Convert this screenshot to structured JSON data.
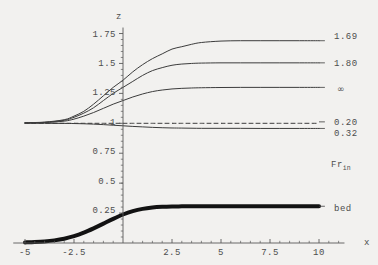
{
  "chart_data": {
    "type": "line",
    "title": "",
    "xlabel": "x",
    "ylabel": "z",
    "xlim": [
      -5,
      10
    ],
    "ylim": [
      0,
      1.8
    ],
    "grid": false,
    "legend_position": "right",
    "x_ticks": [
      "-5",
      "-2.5",
      "2.5",
      "5",
      "7.5",
      "10"
    ],
    "x_tick_values": [
      -5,
      -2.5,
      2.5,
      5,
      7.5,
      10
    ],
    "y_ticks": [
      "1.75",
      "1.5",
      "1.25",
      "1",
      "0.75",
      "0.5",
      "0.25"
    ],
    "y_tick_values": [
      1.75,
      1.5,
      1.25,
      1,
      0.75,
      0.5,
      0.25
    ],
    "legend_title": "Fr",
    "legend_title_sub": "in",
    "series": [
      {
        "name": "1.69",
        "style": "solid",
        "width": 1,
        "color": "#3c3c3c",
        "x": [
          -5,
          -4,
          -3,
          -2.5,
          -2,
          -1.5,
          -1,
          -0.5,
          0,
          0.5,
          1,
          1.5,
          2,
          2.5,
          3,
          3.5,
          4,
          5,
          6,
          7,
          8,
          9,
          10
        ],
        "y": [
          1.005,
          1.01,
          1.03,
          1.06,
          1.1,
          1.16,
          1.23,
          1.3,
          1.36,
          1.43,
          1.49,
          1.54,
          1.58,
          1.62,
          1.64,
          1.66,
          1.675,
          1.687,
          1.69,
          1.69,
          1.69,
          1.69,
          1.69
        ]
      },
      {
        "name": "1.80",
        "style": "solid",
        "width": 1,
        "color": "#3c3c3c",
        "x": [
          -5,
          -4,
          -3,
          -2.5,
          -2,
          -1.5,
          -1,
          -0.5,
          0,
          0.5,
          1,
          1.5,
          2,
          2.5,
          3,
          3.5,
          4,
          5,
          6,
          7,
          8,
          9,
          10
        ],
        "y": [
          1.004,
          1.008,
          1.025,
          1.05,
          1.085,
          1.13,
          1.19,
          1.25,
          1.3,
          1.35,
          1.4,
          1.44,
          1.465,
          1.485,
          1.495,
          1.5,
          1.503,
          1.505,
          1.505,
          1.505,
          1.505,
          1.505,
          1.505
        ]
      },
      {
        "name": "∞",
        "style": "solid",
        "width": 1,
        "color": "#3c3c3c",
        "x": [
          -5,
          -4,
          -3,
          -2.5,
          -2,
          -1.5,
          -1,
          -0.5,
          0,
          0.5,
          1,
          1.5,
          2,
          2.5,
          3,
          3.5,
          4,
          5,
          6,
          7,
          8,
          9,
          10
        ],
        "y": [
          1.003,
          1.006,
          1.018,
          1.035,
          1.06,
          1.09,
          1.125,
          1.16,
          1.19,
          1.22,
          1.245,
          1.265,
          1.278,
          1.287,
          1.292,
          1.295,
          1.297,
          1.299,
          1.3,
          1.3,
          1.3,
          1.3,
          1.3
        ]
      },
      {
        "name": "0.20",
        "style": "dashed",
        "width": 1,
        "color": "#3c3c3c",
        "x": [
          -5,
          -4,
          -3,
          -2.5,
          -2,
          -1.5,
          -1,
          -0.5,
          0,
          0.5,
          1,
          1.5,
          2,
          2.5,
          3,
          4,
          5,
          6,
          7,
          8,
          9,
          10
        ],
        "y": [
          1.0,
          1.0,
          1.0,
          1.0,
          1.0,
          1.0,
          1.0,
          1.0,
          1.0,
          1.0,
          1.0,
          1.0,
          1.0,
          1.0,
          1.0,
          1.0,
          1.0,
          1.0,
          1.0,
          1.0,
          1.0,
          1.0
        ]
      },
      {
        "name": "0.32",
        "style": "solid",
        "width": 1,
        "color": "#3c3c3c",
        "x": [
          -5,
          -4,
          -3,
          -2.5,
          -2,
          -1.5,
          -1,
          -0.5,
          0,
          0.5,
          1,
          1.5,
          2,
          2.5,
          3,
          4,
          5,
          6,
          7,
          8,
          9,
          10
        ],
        "y": [
          1.0,
          1.0,
          0.999,
          0.998,
          0.996,
          0.993,
          0.989,
          0.984,
          0.979,
          0.974,
          0.97,
          0.966,
          0.963,
          0.961,
          0.96,
          0.958,
          0.958,
          0.958,
          0.957,
          0.957,
          0.957,
          0.957
        ]
      },
      {
        "name": "bed",
        "style": "solid",
        "width": 4,
        "color": "#121212",
        "x": [
          -5,
          -4.5,
          -4,
          -3.5,
          -3,
          -2.5,
          -2,
          -1.5,
          -1,
          -0.5,
          0,
          0.5,
          1,
          1.5,
          2,
          2.5,
          3,
          3.5,
          4,
          5,
          6,
          7,
          8,
          9,
          10
        ],
        "y": [
          0.005,
          0.008,
          0.013,
          0.022,
          0.036,
          0.057,
          0.086,
          0.122,
          0.162,
          0.202,
          0.238,
          0.266,
          0.285,
          0.296,
          0.302,
          0.305,
          0.306,
          0.307,
          0.307,
          0.307,
          0.307,
          0.307,
          0.307,
          0.307,
          0.307
        ]
      }
    ],
    "series_end_labels": [
      {
        "label": "1.69",
        "y": 1.69
      },
      {
        "label": "1.80",
        "y": 1.505
      },
      {
        "label": "∞",
        "y": 1.3
      },
      {
        "label": "0.20",
        "y": 1.012
      },
      {
        "label": "0.32",
        "y": 0.957
      },
      {
        "label": "bed",
        "y": 0.307
      }
    ]
  },
  "axes": {
    "x_label": "x",
    "y_label": "z"
  },
  "legend": {
    "title_main": "Fr",
    "title_sub": "in",
    "entries": [
      {
        "label": "1.69"
      },
      {
        "label": "1.80"
      },
      {
        "label": "∞"
      },
      {
        "label": "0.20"
      },
      {
        "label": "0.32"
      },
      {
        "label": "bed"
      }
    ]
  },
  "ticks": {
    "y": [
      {
        "label": "1.75"
      },
      {
        "label": "1.5"
      },
      {
        "label": "1.25"
      },
      {
        "label": "1"
      },
      {
        "label": "0.75"
      },
      {
        "label": "0.5"
      },
      {
        "label": "0.25"
      }
    ],
    "x": [
      {
        "label": "-5"
      },
      {
        "label": "-2.5"
      },
      {
        "label": "2.5"
      },
      {
        "label": "5"
      },
      {
        "label": "7.5"
      },
      {
        "label": "10"
      }
    ]
  }
}
